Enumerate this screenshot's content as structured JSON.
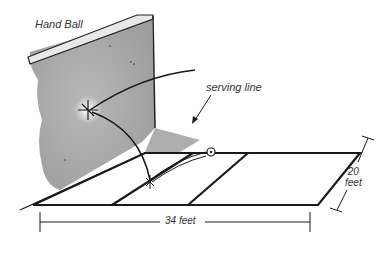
{
  "title": "Hand Ball",
  "annotations": {
    "serving_line": "serving line",
    "court_length": "34 feet",
    "court_width_value": "20",
    "court_width_unit": "feet"
  },
  "colors": {
    "wall": "#a9a9a9",
    "wall_top": "#e6e6e6",
    "line": "#1a1a1a",
    "court": "#ffffff"
  }
}
